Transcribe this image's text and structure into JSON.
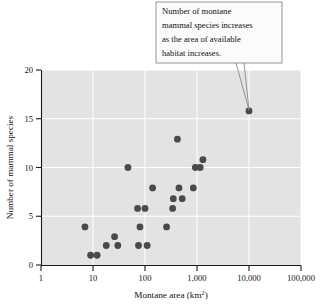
{
  "chart_data": {
    "type": "scatter",
    "title": "",
    "xlabel": "Montane area (km2)",
    "xlabel_base": "Montane area (km",
    "xlabel_sup": "2",
    "xlabel_tail": ")",
    "ylabel": "Number of mammal species",
    "xscale": "log",
    "yscale": "linear",
    "xlim": [
      1,
      100000
    ],
    "ylim": [
      0,
      20
    ],
    "grid": true,
    "grid_color": "#ffffff",
    "plot_background": "#e3e3e3",
    "point_color": "#4a4a4a",
    "legend": "none",
    "xticks": [
      1,
      10,
      100,
      1000,
      10000,
      100000
    ],
    "xticklabels": [
      "1",
      "10",
      "100",
      "1,000",
      "10,000",
      "100,000"
    ],
    "yticks": [
      0,
      5,
      10,
      15,
      20
    ],
    "yticklabels": [
      "0",
      "5",
      "10",
      "15",
      "20"
    ],
    "points": [
      {
        "x": 7,
        "y": 3.9
      },
      {
        "x": 9,
        "y": 1.0
      },
      {
        "x": 12,
        "y": 1.0
      },
      {
        "x": 18,
        "y": 2.0
      },
      {
        "x": 26,
        "y": 2.9
      },
      {
        "x": 30,
        "y": 2.0
      },
      {
        "x": 47,
        "y": 10.0
      },
      {
        "x": 72,
        "y": 5.8
      },
      {
        "x": 75,
        "y": 2.0
      },
      {
        "x": 80,
        "y": 3.9
      },
      {
        "x": 100,
        "y": 5.8
      },
      {
        "x": 110,
        "y": 2.0
      },
      {
        "x": 140,
        "y": 7.9
      },
      {
        "x": 260,
        "y": 3.9
      },
      {
        "x": 340,
        "y": 5.8
      },
      {
        "x": 350,
        "y": 6.8
      },
      {
        "x": 420,
        "y": 12.9
      },
      {
        "x": 450,
        "y": 7.9
      },
      {
        "x": 520,
        "y": 6.8
      },
      {
        "x": 850,
        "y": 7.9
      },
      {
        "x": 930,
        "y": 10.0
      },
      {
        "x": 1150,
        "y": 10.0
      },
      {
        "x": 1300,
        "y": 10.8
      },
      {
        "x": 10000,
        "y": 15.8
      }
    ],
    "annotations": [
      {
        "name": "trend-callout",
        "lines": [
          "Number of montane",
          "mammal species increases",
          "as the area of available",
          "habitat increases."
        ],
        "target_point": {
          "x": 10000,
          "y": 15.8
        }
      }
    ]
  }
}
